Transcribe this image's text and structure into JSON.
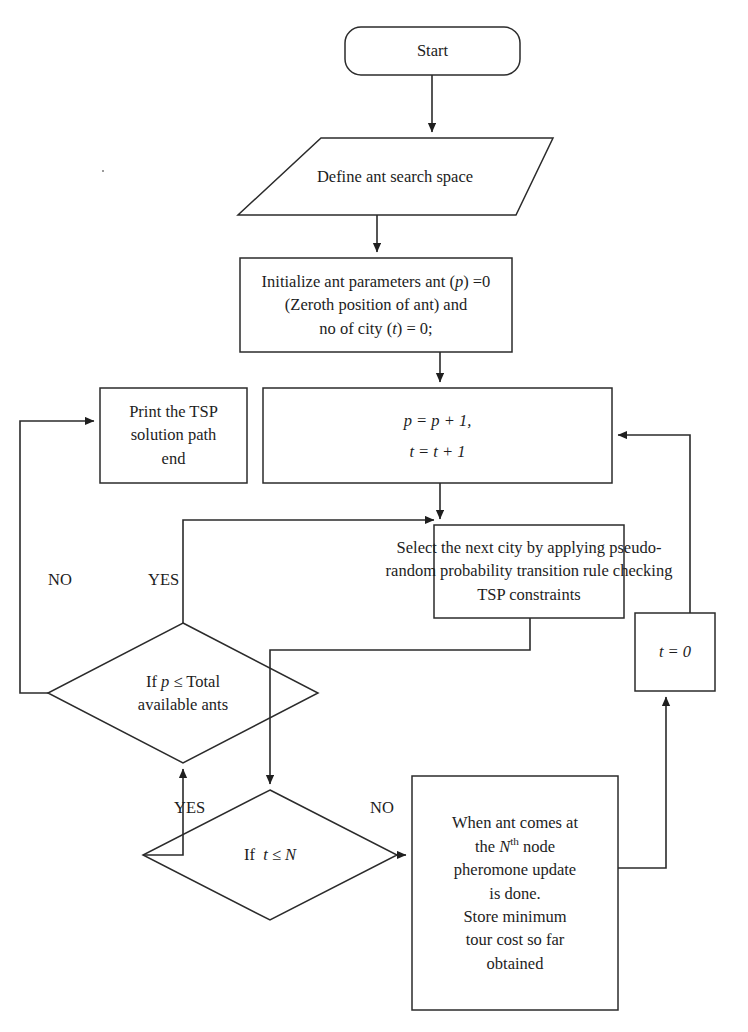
{
  "diagram": {
    "stroke_color": "#2b2b2b",
    "text_color": "#1d1d1d",
    "background": "#ffffff",
    "nodes": [
      {
        "id": "start",
        "shape": "terminator",
        "name": "start-node",
        "lines": [
          "Start"
        ]
      },
      {
        "id": "define-space",
        "shape": "parallelogram",
        "name": "define-search-space-node",
        "lines": [
          "Define ant search space"
        ]
      },
      {
        "id": "initialize",
        "shape": "process",
        "name": "initialize-parameters-node",
        "lines": [
          "Initialize ant parameters ant (p) =0",
          "(Zeroth position of ant) and",
          "no of city (t) = 0;"
        ]
      },
      {
        "id": "print-solution",
        "shape": "process",
        "name": "print-solution-node",
        "lines": [
          "Print the TSP",
          "solution path",
          "end"
        ]
      },
      {
        "id": "increment",
        "shape": "process",
        "name": "increment-counters-node",
        "lines": [
          "p = p + 1,",
          "t = t + 1"
        ]
      },
      {
        "id": "select-city",
        "shape": "process",
        "name": "select-next-city-node",
        "lines": [
          "Select the next city by applying pseudo-",
          "random probability transition rule checking",
          "TSP constraints"
        ]
      },
      {
        "id": "reset-t",
        "shape": "process",
        "name": "reset-city-counter-node",
        "lines": [
          "t = 0"
        ]
      },
      {
        "id": "check-ants",
        "shape": "decision",
        "name": "check-total-ants-decision",
        "lines": [
          "If p ≤ Total",
          "available ants"
        ]
      },
      {
        "id": "check-nodes",
        "shape": "decision",
        "name": "check-node-count-decision",
        "lines": [
          "If t ≤ N"
        ]
      },
      {
        "id": "pheromone",
        "shape": "process",
        "name": "pheromone-update-node",
        "lines": [
          "When ant comes at",
          "the N<sup>th</sup> node",
          "pheromone update",
          "is done.",
          "Store minimum",
          "tour cost so far",
          "obtained"
        ]
      }
    ],
    "edge_labels": [
      {
        "id": "no-ants",
        "name": "edge-label-no-ants",
        "text": "NO"
      },
      {
        "id": "yes-ants",
        "name": "edge-label-yes-ants",
        "text": "YES"
      },
      {
        "id": "yes-nodes",
        "name": "edge-label-yes-nodes",
        "text": "YES"
      },
      {
        "id": "no-nodes",
        "name": "edge-label-no-nodes",
        "text": "NO"
      }
    ]
  }
}
